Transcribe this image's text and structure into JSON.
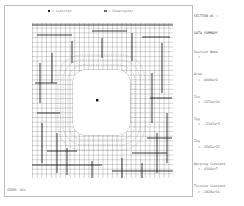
{
  "legend": {
    "centroid_label": "= Centroid",
    "shear_center_label": "= Shearcenter"
  },
  "summary": {
    "title_line1": "SECTION #1 :",
    "title_line2": "DATA SUMMARY",
    "items": [
      {
        "label": "Section Name",
        "value": "="
      },
      {
        "label": "Area",
        "value": "= .0008e+2"
      },
      {
        "label": "Ixx",
        "value": "= .1276e+16"
      },
      {
        "label": "Iyy",
        "value": "= -.5103e+5"
      },
      {
        "label": "Ixy",
        "value": "= .3505e+15"
      },
      {
        "label": "Warping Constant",
        "value": "= .4368e+7"
      },
      {
        "label": "Torsion Constant",
        "value": "= .1828e+16"
      },
      {
        "label": "Centroid Y",
        "value": "= .2956e+7"
      },
      {
        "label": "Centroid X",
        "value": "= -.11499"
      },
      {
        "label": "Shear Center Y",
        "value": "= .2952e+7"
      },
      {
        "label": "Shear Center X",
        "value": "= -.11499"
      },
      {
        "label": "Shear Corr. YY",
        "value": "= .60963"
      },
      {
        "label": "Shear Corr. ZX",
        "value": "= .5e5e-05"
      },
      {
        "label": "Shear Corr. ZZ",
        "value": "= .63954"
      }
    ]
  },
  "footer": {
    "zoom_label": "ZOOM: ALL"
  },
  "colors": {
    "mesh_line": "#333333",
    "frame_border": "#bdbdbd",
    "text": "#666666"
  }
}
